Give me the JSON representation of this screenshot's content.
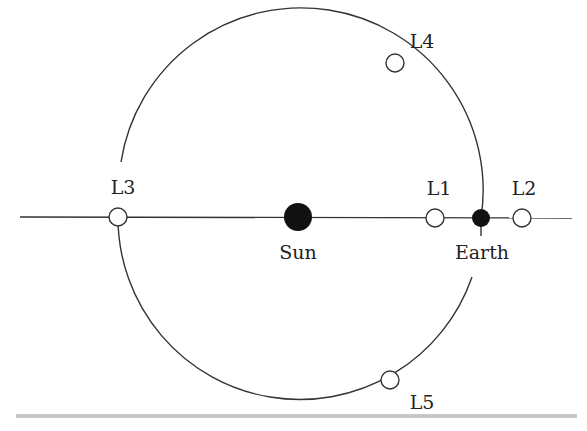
{
  "diagram": {
    "colors": {
      "stroke": "#333333",
      "body_fill": "#111111",
      "point_fill": "#ffffff",
      "bar": "#c8c8c8"
    },
    "bodies": [
      {
        "id": "sun",
        "label": "Sun",
        "x": 298,
        "y": 217,
        "r": 14
      },
      {
        "id": "earth",
        "label": "Earth",
        "x": 481,
        "y": 218,
        "r": 9
      }
    ],
    "points": [
      {
        "id": "L1",
        "label": "L1",
        "x": 435,
        "y": 218
      },
      {
        "id": "L2",
        "label": "L2",
        "x": 522,
        "y": 218
      },
      {
        "id": "L3",
        "label": "L3",
        "x": 118,
        "y": 217
      },
      {
        "id": "L4",
        "label": "L4",
        "x": 395,
        "y": 63
      },
      {
        "id": "L5",
        "label": "L5",
        "x": 390,
        "y": 380
      }
    ]
  }
}
